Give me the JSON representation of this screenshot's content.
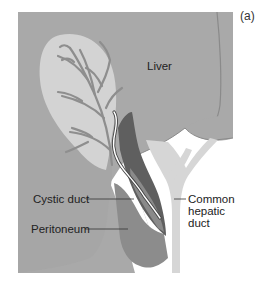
{
  "figure": {
    "panel_label": "(a)",
    "labels": {
      "liver": "Liver",
      "cystic_duct": "Cystic duct",
      "peritoneum": "Peritoneum",
      "common_hepatic_duct_line1": "Common",
      "common_hepatic_duct_line2": "hepatic",
      "common_hepatic_duct_line3": "duct"
    }
  },
  "colors": {
    "background": "#ffffff",
    "liver": "#a9a9a9",
    "liver_outline": "#8a8a8a",
    "gallbladder": "#d3d3d3",
    "vessels": "#8e8e8e",
    "duct": "#d6d6d6",
    "peritoneum_fold": "#8c8c8c",
    "dark_wedge": "#5f5f5f",
    "leader_line": "#333333"
  }
}
